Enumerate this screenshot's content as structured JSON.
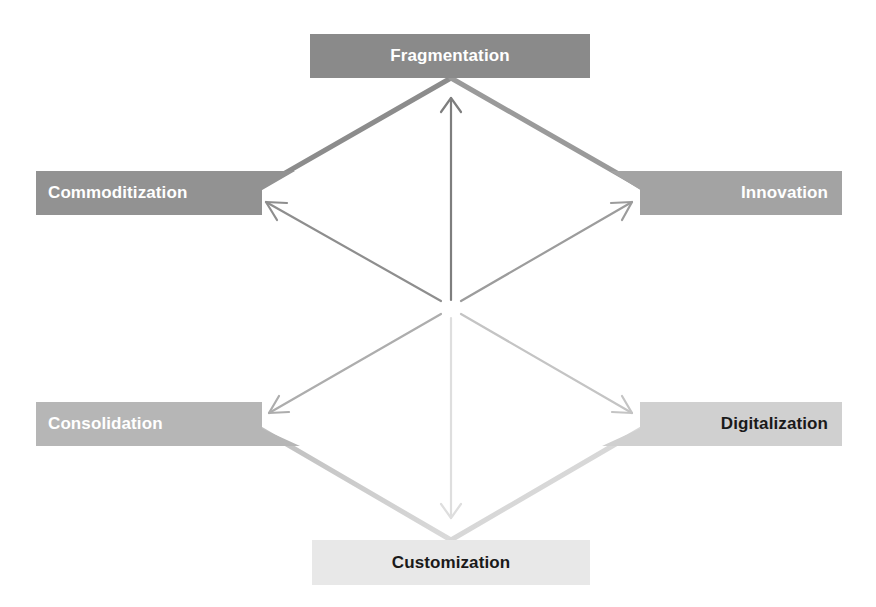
{
  "diagram": {
    "type": "hexagon-forces",
    "center": {
      "x": 451,
      "y": 308
    },
    "labels": {
      "top": {
        "text": "Fragmentation",
        "bg": "#8a8a8a",
        "color": "#ffffff"
      },
      "upper_left": {
        "text": "Commoditization",
        "bg": "#929292",
        "color": "#ffffff"
      },
      "upper_right": {
        "text": "Innovation",
        "bg": "#a3a3a3",
        "color": "#ffffff"
      },
      "lower_left": {
        "text": "Consolidation",
        "bg": "#b6b6b6",
        "color": "#ffffff"
      },
      "lower_right": {
        "text": "Digitalization",
        "bg": "#d0d0d0",
        "color": "#1a1a1a"
      },
      "bottom": {
        "text": "Customization",
        "bg": "#e8e8e8",
        "color": "#1a1a1a"
      }
    },
    "arrows": [
      {
        "to": "top",
        "color": "#7e7e7e"
      },
      {
        "to": "upper_left",
        "color": "#8e8e8e"
      },
      {
        "to": "upper_right",
        "color": "#9c9c9c"
      },
      {
        "to": "lower_left",
        "color": "#adadad"
      },
      {
        "to": "lower_right",
        "color": "#c4c4c4"
      },
      {
        "to": "bottom",
        "color": "#dedede"
      }
    ],
    "hexagon_edge_colors": {
      "top_left": "#8e8e8e",
      "top_right": "#999999",
      "left": "#a0a0a0",
      "right": "#b5b5b5",
      "bottom_left": "#c4c4c4",
      "bottom_right": "#d6d6d6"
    }
  }
}
